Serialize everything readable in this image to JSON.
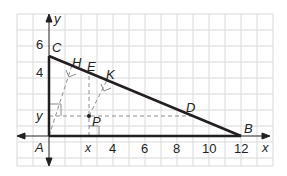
{
  "diagram": {
    "grid": {
      "x_min_units": -2,
      "x_max_units": 14,
      "y_min_units": -2,
      "y_max_units": 7.5,
      "unit_px": 16,
      "color": "#d9d9d9"
    },
    "axes": {
      "x_label": "x",
      "y_label": "y",
      "x_ticks": [
        {
          "value": 4,
          "label": "4"
        },
        {
          "value": 6,
          "label": "6"
        },
        {
          "value": 8,
          "label": "8"
        },
        {
          "value": 10,
          "label": "10"
        },
        {
          "value": 12,
          "label": "12"
        }
      ],
      "y_ticks": [
        {
          "value": 4,
          "label": "4"
        },
        {
          "value": 6,
          "label": "6"
        }
      ],
      "x_variable_label": "x",
      "y_variable_label": "y"
    },
    "points": {
      "A": {
        "label": "A",
        "x": 0,
        "y": 0
      },
      "B": {
        "label": "B",
        "x": 12,
        "y": 0
      },
      "C": {
        "label": "C",
        "x": 0,
        "y": 5
      },
      "H": {
        "label": "H",
        "x": 1.42,
        "y": 4.41
      },
      "E": {
        "label": "E",
        "x": 2.5,
        "y": 3.96
      },
      "K": {
        "label": "K",
        "x": 3.6,
        "y": 3.5
      },
      "D": {
        "label": "D",
        "x": 9,
        "y": 1.25
      },
      "P": {
        "label": "P",
        "x": 2.5,
        "y": 1.25
      }
    },
    "triangle": {
      "vertices": [
        "A",
        "B",
        "C"
      ],
      "stroke": "#231f20"
    },
    "dashed_color": "#8c8c8c"
  }
}
